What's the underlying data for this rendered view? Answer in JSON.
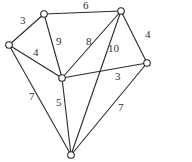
{
  "graph": {
    "nodes": [
      {
        "id": "A"
      },
      {
        "id": "B"
      },
      {
        "id": "C"
      },
      {
        "id": "D"
      },
      {
        "id": "E"
      },
      {
        "id": "F"
      }
    ],
    "edges": [
      {
        "from": "A",
        "to": "B",
        "weight": "6"
      },
      {
        "from": "A",
        "to": "C",
        "weight": "3"
      },
      {
        "from": "A",
        "to": "E",
        "weight": "9"
      },
      {
        "from": "C",
        "to": "E",
        "weight": "4"
      },
      {
        "from": "E",
        "to": "B",
        "weight": "8"
      },
      {
        "from": "B",
        "to": "F",
        "weight": "10"
      },
      {
        "from": "B",
        "to": "D",
        "weight": "4"
      },
      {
        "from": "E",
        "to": "D",
        "weight": "3"
      },
      {
        "from": "C",
        "to": "F",
        "weight": "7"
      },
      {
        "from": "E",
        "to": "F",
        "weight": "5"
      },
      {
        "from": "D",
        "to": "F",
        "weight": "7"
      }
    ]
  }
}
